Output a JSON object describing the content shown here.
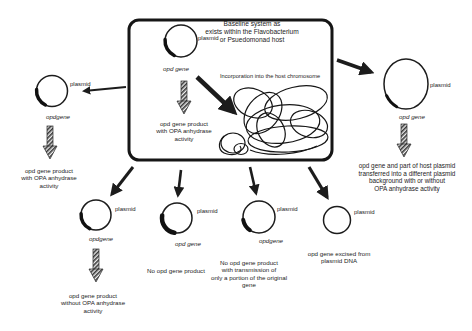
{
  "figure": {
    "background": "#ffffff",
    "ink_color": "#1c1c1c"
  },
  "box": {
    "title": "Baseline system as\nexists within the Flavobacterium\nor Psuedomonad host",
    "plasmid_label": "plasmid",
    "gene_label": "opd gene",
    "incorporation_label": "Incorporation into the host chromosome",
    "product_text": "opd gene product\nwith OPA anhydrase\nactivity"
  },
  "left_branch": {
    "plasmid_label": "plasmid",
    "gene_label": "opdgene",
    "product_text": "opd gene product\nwith OPA anhydrase\nactivity"
  },
  "right_branch": {
    "plasmid_label": "plasmid",
    "gene_label": "opd gene",
    "product_text": "opd gene and part of host plasmid\ntransferred into a different plasmid\nbackground with or without\nOPA anhydrase activity"
  },
  "bottom_branches": [
    {
      "plasmid_label": "plasmid",
      "gene_label": "opdgene",
      "product_text": "opd gene product\nwithout OPA anhydrase\nactivity"
    },
    {
      "plasmid_label": "plasmid",
      "gene_label": "opd gene",
      "product_text": "No opd gene product"
    },
    {
      "plasmid_label": "plasmid",
      "gene_label": "opdgene",
      "product_text": "No opd gene product\nwith transmission of\nonly a portion of the original\ngene"
    },
    {
      "plasmid_label": "plasmid",
      "product_text": "opd gene excised from\nplasmid DNA"
    }
  ]
}
